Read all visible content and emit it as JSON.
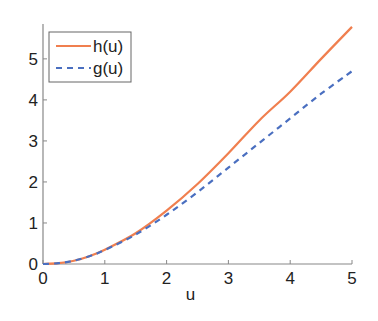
{
  "chart_data": {
    "type": "line",
    "title": "",
    "xlabel": "u",
    "ylabel": "",
    "xlim": [
      0,
      5
    ],
    "ylim": [
      0,
      5.85
    ],
    "xticks": [
      0,
      1,
      2,
      3,
      4,
      5
    ],
    "yticks": [
      0,
      1,
      2,
      3,
      4,
      5
    ],
    "xtick_labels": [
      "0",
      "1",
      "2",
      "3",
      "4",
      "5"
    ],
    "ytick_labels": [
      "0",
      "1",
      "2",
      "3",
      "4",
      "5"
    ],
    "grid": false,
    "legend_position": "top-left",
    "x": [
      0,
      0.25,
      0.5,
      0.75,
      1,
      1.5,
      2,
      2.5,
      3,
      3.5,
      4,
      4.5,
      5
    ],
    "series": [
      {
        "name": "h(u)",
        "color": "#f07f4f",
        "style": "solid",
        "values": [
          0,
          0.02,
          0.08,
          0.19,
          0.35,
          0.75,
          1.3,
          1.95,
          2.7,
          3.5,
          4.2,
          5.0,
          5.78
        ]
      },
      {
        "name": "g(u)",
        "color": "#4a6fc0",
        "style": "dashed",
        "values": [
          0,
          0.02,
          0.08,
          0.19,
          0.34,
          0.72,
          1.2,
          1.75,
          2.35,
          2.95,
          3.55,
          4.15,
          4.7
        ]
      }
    ]
  }
}
